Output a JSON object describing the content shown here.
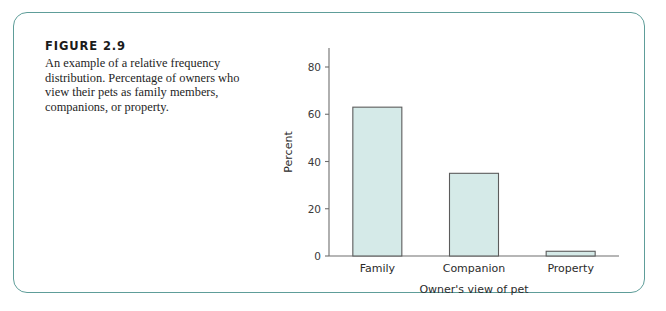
{
  "figure": {
    "title": "FIGURE 2.9",
    "caption": "An example of a relative frequency distribution. Percentage of owners who view their pets as family members, companions, or property."
  },
  "colors": {
    "frame_border": "#5e9d99",
    "bar_fill": "#d5eae8",
    "bar_outline": "#5c5c5c",
    "axis": "#6e6e6e",
    "text": "#1e1e1e"
  },
  "chart_data": {
    "type": "bar",
    "title": "",
    "categories": [
      "Family",
      "Companion",
      "Property"
    ],
    "values": [
      63,
      35,
      2
    ],
    "xlabel": "Owner's view of pet",
    "ylabel": "Percent",
    "ylim": [
      0,
      88
    ],
    "yticks": [
      0,
      20,
      40,
      60,
      80
    ],
    "ytick_labels": [
      "0",
      "20",
      "40",
      "60",
      "80"
    ],
    "grid": false,
    "legend": false
  }
}
